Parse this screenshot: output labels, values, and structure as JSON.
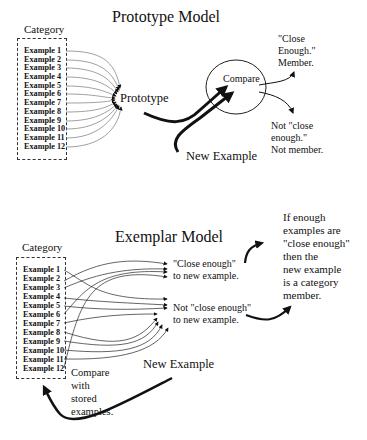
{
  "prototype_model": {
    "title": "Prototype Model",
    "category_label": "Category",
    "examples": [
      "Example 1",
      "Example 2",
      "Example 3",
      "Example 4",
      "Example 5",
      "Example 6",
      "Example 7",
      "Example 8",
      "Example 9",
      "Example 10",
      "Example 11",
      "Example 12"
    ],
    "prototype_label": "Prototype",
    "compare_label": "Compare",
    "new_example_label": "New Example",
    "member_outcome": "\"Close\nEnough.\"\nMember.",
    "nonmember_outcome": "Not \"close\nenough.\"\nNot member."
  },
  "exemplar_model": {
    "title": "Exemplar Model",
    "category_label": "Category",
    "examples": [
      "Example 1",
      "Example 2",
      "Example 3",
      "Example 4",
      "Example 5",
      "Example 6",
      "Example 7",
      "Example 8",
      "Example 9",
      "Example 10",
      "Example 11",
      "Example 12"
    ],
    "close_enough_label": "\"Close enough\"\nto new example.",
    "not_close_enough_label": "Not \"close enough\"\nto new example.",
    "conclusion": "If enough\nexamples are\n\"close enough\"\nthen the\nnew example\nis a category\nmember.",
    "new_example_label": "New Example",
    "compare_note": "Compare\nwith\nstored\nexamples."
  }
}
